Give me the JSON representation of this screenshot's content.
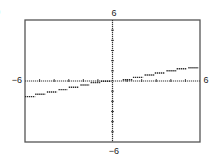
{
  "panel_label": ")",
  "colors": {
    "frame": "#555555",
    "axis": "#333333",
    "plot": "#2a2a2a",
    "text": "#222222",
    "background": "#ffffff"
  },
  "chart_data": {
    "type": "line",
    "subtype": "step",
    "title": "",
    "xlabel": "",
    "ylabel": "",
    "xlim": [
      -6,
      6
    ],
    "ylim": [
      -6,
      6
    ],
    "grid": false,
    "legend": null,
    "axis_labels": {
      "x_min": "−6",
      "x_max": "6",
      "y_min": "−6",
      "y_max": "6"
    },
    "x_ticks": [
      -5,
      -4,
      -3,
      -2,
      -1,
      1,
      2,
      3,
      4,
      5
    ],
    "y_ticks": [
      -5,
      -4,
      -3,
      -2,
      -1,
      1,
      2,
      3,
      4,
      5
    ],
    "series": [
      {
        "name": "step function",
        "segments": [
          {
            "x0": -6.0,
            "x1": -5.3,
            "y": -1.54
          },
          {
            "x0": -5.3,
            "x1": -4.6,
            "y": -1.31
          },
          {
            "x0": -4.5,
            "x1": -3.8,
            "y": -1.08
          },
          {
            "x0": -3.7,
            "x1": -3.1,
            "y": -0.85
          },
          {
            "x0": -3.0,
            "x1": -2.3,
            "y": -0.62
          },
          {
            "x0": -2.2,
            "x1": -1.6,
            "y": -0.39
          },
          {
            "x0": -1.5,
            "x1": -0.8,
            "y": -0.16
          },
          {
            "x0": -0.8,
            "x1": -0.1,
            "y": -0.03
          },
          {
            "x0": 0.7,
            "x1": 1.4,
            "y": 0.13
          },
          {
            "x0": 1.4,
            "x1": 2.1,
            "y": 0.36
          },
          {
            "x0": 2.2,
            "x1": 2.9,
            "y": 0.59
          },
          {
            "x0": 2.9,
            "x1": 3.6,
            "y": 0.79
          },
          {
            "x0": 3.7,
            "x1": 4.4,
            "y": 1.01
          },
          {
            "x0": 4.4,
            "x1": 5.1,
            "y": 1.21
          },
          {
            "x0": 5.2,
            "x1": 5.9,
            "y": 1.31
          }
        ]
      }
    ]
  }
}
